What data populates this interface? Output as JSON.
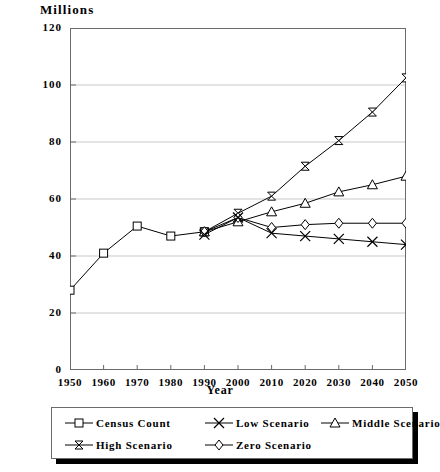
{
  "chart_data": {
    "type": "line",
    "title": "",
    "ylabel": "Millions",
    "xlabel": "Year",
    "ylim": [
      0,
      120
    ],
    "yticks": [
      0,
      20,
      40,
      60,
      80,
      100,
      120
    ],
    "x": [
      1950,
      1960,
      1970,
      1980,
      1990,
      2000,
      2010,
      2020,
      2030,
      2040,
      2050
    ],
    "xticks": [
      "1950",
      "1960",
      "1970",
      "1980",
      "1990",
      "2000",
      "2010",
      "2020",
      "2030",
      "2040",
      "2050"
    ],
    "grid": "horizontal",
    "legend_position": "bottom",
    "series": [
      {
        "name": "Census Count",
        "marker": "square",
        "x": [
          1950,
          1960,
          1970,
          1980,
          1990
        ],
        "values": [
          28,
          41,
          50.5,
          47,
          48.5
        ]
      },
      {
        "name": "High Scenario",
        "marker": "bowtie",
        "x": [
          1990,
          2000,
          2010,
          2020,
          2030,
          2040,
          2050
        ],
        "values": [
          48.5,
          55,
          61,
          71.5,
          80.5,
          90.5,
          102.5
        ]
      },
      {
        "name": "Middle Scenario",
        "marker": "triangle",
        "x": [
          1990,
          2000,
          2010,
          2020,
          2030,
          2040,
          2050
        ],
        "values": [
          48.5,
          52,
          55.5,
          58.5,
          62.5,
          65,
          68
        ]
      },
      {
        "name": "Zero Scenario",
        "marker": "diamond",
        "x": [
          1990,
          2000,
          2010,
          2020,
          2030,
          2040,
          2050
        ],
        "values": [
          48.5,
          53.5,
          50,
          51,
          51.5,
          51.5,
          51.5
        ]
      },
      {
        "name": "Low Scenario",
        "marker": "cross",
        "x": [
          1990,
          2000,
          2010,
          2020,
          2030,
          2040,
          2050
        ],
        "values": [
          47.5,
          53.5,
          48,
          47,
          46,
          45,
          44
        ]
      }
    ],
    "colors": {
      "line": "#000000",
      "grid": "#c9c9c9",
      "axis": "#6b6b6b",
      "background": "#ffffff"
    }
  },
  "legend": {
    "rows": [
      [
        {
          "label": "Census Count",
          "marker": "square"
        },
        {
          "label": "Low Scenario",
          "marker": "cross"
        },
        {
          "label": "Middle Scenario",
          "marker": "triangle"
        }
      ],
      [
        {
          "label": "High Scenario",
          "marker": "bowtie"
        },
        {
          "label": "Zero Scenario",
          "marker": "diamond"
        }
      ]
    ]
  }
}
